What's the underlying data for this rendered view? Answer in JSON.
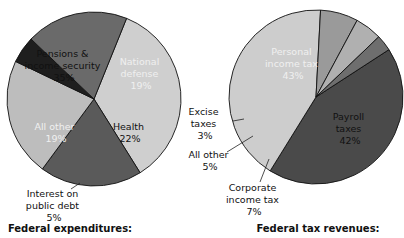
{
  "chart_data": [
    {
      "type": "pie",
      "title": "Federal expenditures:",
      "categories": [
        "Pensions & income security",
        "National defense",
        "Health",
        "Interest on public debt",
        "All other"
      ],
      "values": [
        35,
        19,
        22,
        5,
        19
      ],
      "colors": [
        "#cfcfcf",
        "#5a5a5a",
        "#bdbdbd",
        "#1e1e1e",
        "#6a6a6a"
      ],
      "labels": [
        {
          "lines": [
            "Pensions &",
            "income security",
            "35%"
          ]
        },
        {
          "lines": [
            "National",
            "defense",
            "19%"
          ]
        },
        {
          "lines": [
            "Health",
            "22%"
          ]
        },
        {
          "lines": [
            "Interest on",
            "public debt",
            "5%"
          ]
        },
        {
          "lines": [
            "All other",
            "19%"
          ]
        }
      ]
    },
    {
      "type": "pie",
      "title": "Federal tax revenues:",
      "categories": [
        "Personal income tax",
        "Payroll taxes",
        "Corporate income tax",
        "All other",
        "Excise taxes"
      ],
      "values": [
        43,
        42,
        7,
        5,
        3
      ],
      "colors": [
        "#4a4a4a",
        "#cdcdcd",
        "#9a9a9a",
        "#b0b0b0",
        "#6e6e6e"
      ],
      "labels": [
        {
          "lines": [
            "Personal",
            "income tax",
            "43%"
          ]
        },
        {
          "lines": [
            "Payroll",
            "taxes",
            "42%"
          ]
        },
        {
          "lines": [
            "Corporate",
            "income tax",
            "7%"
          ]
        },
        {
          "lines": [
            "All other",
            "5%"
          ]
        },
        {
          "lines": [
            "Excise",
            "taxes",
            "3%"
          ]
        }
      ]
    }
  ]
}
